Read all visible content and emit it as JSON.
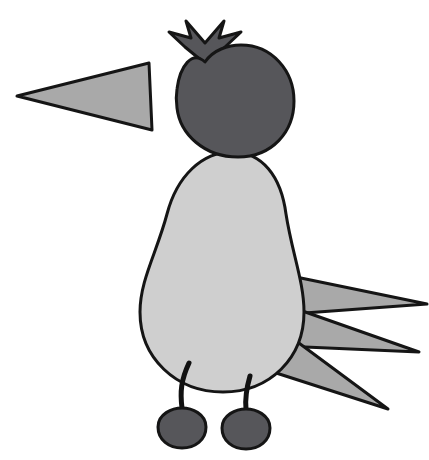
{
  "image": {
    "kind": "clipart-illustration",
    "subject": "bird",
    "title": "Cartoon bird facing left with crest, long beak and three tail feathers",
    "background_color": "#ffffff",
    "width": 429,
    "height": 460
  },
  "palette": {
    "outline": "#151515",
    "dark_gray": "#56565a",
    "mid_gray": "#a9a9a9",
    "light_gray": "#cfcfcf",
    "black": "#111111",
    "white": "#ffffff"
  },
  "parts": [
    {
      "id": "crest",
      "label": "Crest",
      "shape": "double-chevron",
      "fill": "#56565a",
      "stroke": "#151515",
      "stroke_width": 3,
      "path": "M 186 21 L 205 43 L 224 21 L 219 38 L 241 32 L 225 47 L 214 57 L 205 63 L 196 56 L 185 47 L 169 32 L 191 38 Z"
    },
    {
      "id": "beak",
      "label": "Beak",
      "shape": "triangle",
      "fill": "#a9a9a9",
      "stroke": "#151515",
      "stroke_width": 3,
      "path": "M 17 96 L 149 63 L 152 130 Z"
    },
    {
      "id": "head",
      "label": "Head",
      "shape": "ellipse-with-notch",
      "fill": "#56565a",
      "stroke": "#151515",
      "stroke_width": 3,
      "path": "M 205 62 C 213 50 228 45 241 45 C 272 45 294 71 294 101 C 294 132 272 157 238 157 C 204 157 180 134 177 108 C 176 101 176 95 177 89 C 180 66 192 50 205 62 Z"
    },
    {
      "id": "body",
      "label": "Body",
      "shape": "pear",
      "fill": "#cfcfcf",
      "stroke": "#151515",
      "stroke_width": 3,
      "path": "M 232 152 C 262 152 281 176 286 214 C 292 253 304 282 304 312 C 304 358 270 392 223 392 C 176 392 140 358 140 312 C 140 280 157 252 167 214 C 177 176 202 152 232 152 Z"
    },
    {
      "id": "tail-feather-top",
      "label": "Tail feather (top)",
      "shape": "triangle",
      "fill": "#a9a9a9",
      "stroke": "#151515",
      "stroke_width": 3,
      "path": "M 427 304 L 296 277 L 291 314 Z"
    },
    {
      "id": "tail-feather-middle",
      "label": "Tail feather (middle)",
      "shape": "triangle",
      "fill": "#a9a9a9",
      "stroke": "#151515",
      "stroke_width": 3,
      "path": "M 419 352 L 291 307 L 282 346 Z"
    },
    {
      "id": "tail-feather-bottom",
      "label": "Tail feather (bottom)",
      "shape": "triangle",
      "fill": "#a9a9a9",
      "stroke": "#151515",
      "stroke_width": 3,
      "path": "M 388 409 L 284 332 L 270 371 Z"
    },
    {
      "id": "leg-left",
      "label": "Left leg",
      "shape": "curved-line",
      "fill": "none",
      "stroke": "#111111",
      "stroke_width": 5,
      "path": "M 189 363 C 181 380 180 392 182 408"
    },
    {
      "id": "leg-right",
      "label": "Right leg",
      "shape": "curved-line",
      "fill": "none",
      "stroke": "#111111",
      "stroke_width": 5,
      "path": "M 250 376 C 246 390 245 399 246 409"
    },
    {
      "id": "foot-left",
      "label": "Left foot",
      "shape": "cherry",
      "fill": "#56565a",
      "stroke": "#151515",
      "stroke_width": 3,
      "path": "M 182 408 C 192 408 206 414 206 427 C 206 440 195 448 182 448 C 169 448 158 440 158 427 C 158 414 172 408 182 408 Z"
    },
    {
      "id": "foot-right",
      "label": "Right foot",
      "shape": "cherry",
      "fill": "#56565a",
      "stroke": "#151515",
      "stroke_width": 3,
      "path": "M 246 409 C 256 409 270 415 270 428 C 270 441 259 449 246 449 C 233 449 222 441 222 428 C 222 415 236 409 246 409 Z"
    }
  ]
}
